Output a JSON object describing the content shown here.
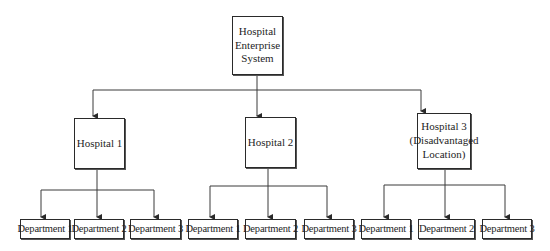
{
  "diagram": {
    "title": "Hospital Enterprise System",
    "root": {
      "label": "Hospital Enterprise System",
      "lines": [
        "Hospital",
        "Enterprise",
        "System"
      ]
    },
    "hospitals": [
      {
        "label": "Hospital 1",
        "lines": [
          "Hospital 1"
        ],
        "departments": [
          "Department 1",
          "Department 2",
          "Department 3"
        ]
      },
      {
        "label": "Hospital 2",
        "lines": [
          "Hospital 2"
        ],
        "departments": [
          "Department 1",
          "Department 2",
          "Department 3"
        ]
      },
      {
        "label": "Hospital 3 (Disadvantaged Location)",
        "lines": [
          "Hospital 3",
          "(Disadvantaged",
          "Location)"
        ],
        "departments": [
          "Department 1",
          "Department 2",
          "Department 3"
        ]
      }
    ],
    "edges": [
      {
        "from": "Hospital Enterprise System",
        "to": "Hospital 1"
      },
      {
        "from": "Hospital Enterprise System",
        "to": "Hospital 2"
      },
      {
        "from": "Hospital Enterprise System",
        "to": "Hospital 3 (Disadvantaged Location)"
      },
      {
        "from": "Hospital 1",
        "to": "Department 1"
      },
      {
        "from": "Hospital 1",
        "to": "Department 2"
      },
      {
        "from": "Hospital 1",
        "to": "Department 3"
      },
      {
        "from": "Hospital 2",
        "to": "Department 1"
      },
      {
        "from": "Hospital 2",
        "to": "Department 2"
      },
      {
        "from": "Hospital 2",
        "to": "Department 3"
      },
      {
        "from": "Hospital 3 (Disadvantaged Location)",
        "to": "Department 1"
      },
      {
        "from": "Hospital 3 (Disadvantaged Location)",
        "to": "Department 2"
      },
      {
        "from": "Hospital 3 (Disadvantaged Location)",
        "to": "Department 3"
      }
    ],
    "colors": {
      "line": "#3a3a3a",
      "border": "#2a2a2a",
      "background": "#ffffff",
      "text": "#1e1e1e"
    }
  }
}
